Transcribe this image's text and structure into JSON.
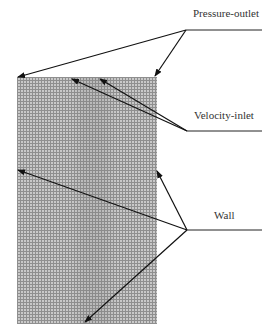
{
  "diagram": {
    "type": "CFD mesh boundary conditions",
    "labels": {
      "pressure_outlet": "Pressure-outlet",
      "velocity_inlet": "Velocity-inlet",
      "wall": "Wall"
    },
    "colors": {
      "mesh_fill": "#c9c9c9",
      "mesh_lines": "#8f8f8f",
      "arrows": "#111111",
      "text": "#333333"
    }
  }
}
